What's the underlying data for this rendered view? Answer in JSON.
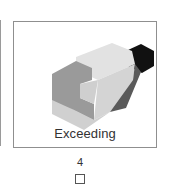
{
  "card": {
    "label": "Exceeding",
    "image": "isometric-block-figure",
    "colors": {
      "border": "#8f8f8f",
      "top_light": "#e6e6e6",
      "front_light": "#d9d9d9",
      "mid_gray": "#9b9b9b",
      "dark_gray": "#555555",
      "black": "#111111",
      "bottom_light": "#d0d0d0"
    }
  },
  "option": {
    "number": "4",
    "checked": false
  }
}
